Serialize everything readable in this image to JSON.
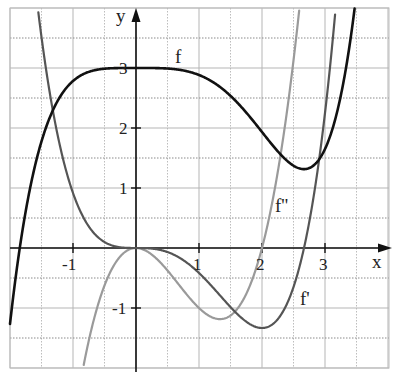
{
  "chart_data": {
    "type": "line",
    "title": "",
    "xlabel": "x",
    "ylabel": "y",
    "xlim": [
      -2.0,
      4.0
    ],
    "ylim": [
      -2.0,
      4.0
    ],
    "grid": true,
    "grid_step": 0.5,
    "x_ticks": [
      -1,
      1,
      2,
      3
    ],
    "y_ticks": [
      -1,
      1,
      2,
      3
    ],
    "series": [
      {
        "name": "f",
        "formula": "x^5/20 - x^4/6 + 3",
        "color": "#111111",
        "width": 2.6,
        "label_pos": [
          0.33,
          3.28
        ],
        "x": [
          -2.0,
          -1.84,
          -1.5,
          -1.0,
          -0.5,
          0,
          0.5,
          1.0,
          1.5,
          2.0,
          2.5,
          2.67,
          3.0,
          3.3
        ],
        "values": [
          -1.27,
          0.0,
          1.78,
          2.78,
          2.99,
          3.0,
          2.99,
          2.88,
          2.53,
          1.93,
          1.39,
          1.31,
          1.65,
          3.53
        ]
      },
      {
        "name": "f'",
        "formula": "x^4/4 - 2x^3/3",
        "color": "#555555",
        "width": 2.2,
        "label_pos": [
          2.78,
          -0.85
        ],
        "x": [
          -1.5,
          -1.0,
          -0.5,
          0,
          0.5,
          1.0,
          1.5,
          2.0,
          2.5,
          2.67,
          3.0,
          3.3
        ],
        "values": [
          3.52,
          0.92,
          0.1,
          0.0,
          -0.07,
          -0.42,
          -0.98,
          -1.33,
          -0.65,
          0.0,
          2.25,
          4.8
        ]
      },
      {
        "name": "f''",
        "formula": "x^3 - 2x^2",
        "color": "#9a9a9a",
        "width": 2.2,
        "label_pos": [
          2.22,
          0.55
        ],
        "x": [
          -0.85,
          -0.5,
          0,
          0.5,
          1.0,
          1.33,
          1.5,
          2.0,
          2.5,
          3.0
        ],
        "values": [
          -2.06,
          -0.63,
          0.0,
          -0.38,
          -1.0,
          -1.19,
          -1.13,
          0.0,
          3.13,
          9.0
        ]
      }
    ]
  },
  "axes": {
    "x_label": "x",
    "y_label": "y",
    "x_tick_labels": [
      "-1",
      "1",
      "2",
      "3"
    ],
    "y_tick_labels": [
      "3",
      "2",
      "1",
      "-1"
    ]
  },
  "legend_labels": {
    "f": "f",
    "f_prime": "f'",
    "f_double_prime": "f''"
  }
}
